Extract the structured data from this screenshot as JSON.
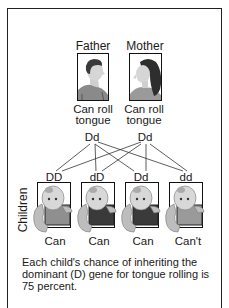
{
  "parents": {
    "father": {
      "label": "Father",
      "trait_line1": "Can roll",
      "trait_line2": "tongue",
      "genotype": "Dd"
    },
    "mother": {
      "label": "Mother",
      "trait_line1": "Can roll",
      "trait_line2": "tongue",
      "genotype": "Dd"
    }
  },
  "children_label": "Children",
  "children": [
    {
      "genotype": "DD",
      "phenotype": "Can",
      "shirt_color": "#8f8f8f"
    },
    {
      "genotype": "dD",
      "phenotype": "Can",
      "shirt_color": "#3a3a3a"
    },
    {
      "genotype": "Dd",
      "phenotype": "Can",
      "shirt_color": "#3a3a3a"
    },
    {
      "genotype": "dd",
      "phenotype": "Can't",
      "shirt_color": "#9a9a9a"
    }
  ],
  "caption": "Each child's chance of inheriting the dominant (D) gene for tongue rolling is 75 percent.",
  "colors": {
    "frame": "#222222",
    "line": "#333333",
    "skin": "#cfcfcf",
    "shadow": "#8a8a8a"
  }
}
